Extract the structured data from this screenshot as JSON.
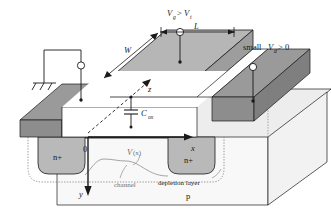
{
  "figure": {
    "type": "semiconductor-device-diagram"
  },
  "colors": {
    "outline": "#1a1a1a",
    "gate_top": "#b6b6b6",
    "gate_front": "#c9c9c9",
    "gate_side": "#9d9d9d",
    "contact_dark": "#9a9a9a",
    "contact_front": "#8d8d8d",
    "oxide_white": "#ffffff",
    "substrate_top": "#ededed",
    "substrate_front": "#f7f7f7",
    "nplus_fill": "#b9b9b9",
    "text": "#1a1a1a",
    "text_gray": "#6f6f6f"
  },
  "labels": {
    "gate_voltage": {
      "v": "V",
      "sub": "g",
      "rel": ">",
      "vt": "V",
      "vt_sub": "t"
    },
    "gate_voltage_full": "Vg > Vt",
    "channel_length": "L",
    "channel_width": "W",
    "drain_voltage_prefix": "small",
    "drain_voltage": {
      "v": "V",
      "sub": "d",
      "rel": "> 0"
    },
    "drain_voltage_full": "small Vd > 0",
    "oxide_cap": {
      "c": "C",
      "sub": "ox"
    },
    "oxide_cap_full": "Cox",
    "axis_x": "x",
    "axis_y": "y",
    "axis_z": "z",
    "origin": "0",
    "potential": {
      "v": "V",
      "arg": "(x)"
    },
    "potential_full": "V(x)",
    "channel": "channel",
    "depletion_layer": "depletion layer",
    "source_region": "n+",
    "drain_region": "n+",
    "substrate_region": "p",
    "ground": "ground-symbol"
  }
}
